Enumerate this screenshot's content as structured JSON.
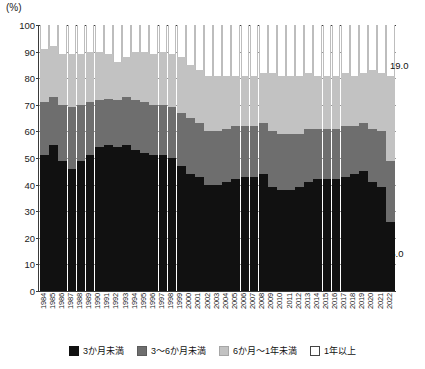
{
  "chart_data": {
    "type": "bar",
    "subtype": "stacked-100-percent",
    "title": "",
    "xlabel": "",
    "ylabel": "(%)",
    "ylim": [
      0,
      100
    ],
    "yticks": [
      0,
      10,
      20,
      30,
      40,
      50,
      60,
      70,
      80,
      90,
      100
    ],
    "grid": true,
    "legend_position": "bottom",
    "categories": [
      "1984",
      "1985",
      "1986",
      "1987",
      "1988",
      "1989",
      "1990",
      "1991",
      "1992",
      "1993",
      "1994",
      "1995",
      "1996",
      "1997",
      "1998",
      "1999",
      "2000",
      "2001",
      "2002",
      "2003",
      "2004",
      "2005",
      "2006",
      "2007",
      "2008",
      "2009",
      "2010",
      "2011",
      "2012",
      "2013",
      "2014",
      "2015",
      "2016",
      "2017",
      "2018",
      "2019",
      "2020",
      "2021",
      "2022"
    ],
    "series": [
      {
        "name": "3か月未満",
        "color": "#111111",
        "values": [
          51.0,
          55.0,
          49.0,
          46.0,
          49.0,
          51.0,
          54.0,
          55.0,
          54.0,
          55.0,
          53.0,
          52.0,
          51.0,
          51.0,
          50.0,
          47.0,
          44.0,
          43.0,
          40.0,
          40.0,
          41.0,
          42.0,
          43.0,
          43.0,
          44.0,
          39.0,
          38.0,
          38.0,
          39.0,
          41.0,
          42.0,
          42.0,
          42.0,
          43.0,
          44.0,
          45.0,
          41.0,
          39.0,
          26.0
        ]
      },
      {
        "name": "3～6か月未満",
        "color": "#6e6e6e",
        "values": [
          20.0,
          18.0,
          21.0,
          23.0,
          21.0,
          20.0,
          18.0,
          17.0,
          18.0,
          18.0,
          19.0,
          19.0,
          19.0,
          19.0,
          19.0,
          20.0,
          21.0,
          20.0,
          20.0,
          20.0,
          20.0,
          20.0,
          19.0,
          19.0,
          19.0,
          21.0,
          21.0,
          21.0,
          20.0,
          20.0,
          19.0,
          19.0,
          19.0,
          19.0,
          18.0,
          18.0,
          20.0,
          21.0,
          23.0
        ]
      },
      {
        "name": "6か月～1年未満",
        "color": "#c2c2c2",
        "values": [
          20.0,
          19.0,
          19.0,
          20.0,
          19.0,
          19.0,
          18.0,
          17.0,
          14.0,
          15.0,
          18.0,
          19.0,
          19.0,
          20.0,
          20.0,
          21.0,
          20.0,
          20.0,
          21.0,
          21.0,
          20.0,
          19.0,
          19.0,
          19.0,
          19.0,
          22.0,
          22.0,
          22.0,
          22.0,
          21.0,
          20.0,
          20.0,
          20.0,
          20.0,
          19.0,
          19.0,
          22.0,
          22.0,
          32.0
        ]
      },
      {
        "name": "1年以上",
        "color": "#ffffff",
        "values": [
          9.0,
          8.0,
          11.0,
          11.0,
          11.0,
          10.0,
          10.0,
          11.0,
          14.0,
          12.0,
          10.0,
          10.0,
          11.0,
          10.0,
          11.0,
          12.0,
          15.0,
          17.0,
          19.0,
          19.0,
          19.0,
          19.0,
          19.0,
          19.0,
          18.0,
          18.0,
          19.0,
          19.0,
          19.0,
          18.0,
          19.0,
          19.0,
          19.0,
          18.0,
          19.0,
          18.0,
          17.0,
          18.0,
          19.0
        ]
      }
    ],
    "annotations": [
      {
        "id": "top",
        "text": "19.0",
        "series": "1年以上",
        "category": "2022"
      },
      {
        "id": "bottom",
        "text": "26.0",
        "series": "3か月未満",
        "category": "2022"
      }
    ]
  },
  "legend": {
    "items": [
      {
        "label": "3か月未満"
      },
      {
        "label": "3～6か月未満"
      },
      {
        "label": "6か月～1年未満"
      },
      {
        "label": "1年以上"
      }
    ]
  }
}
